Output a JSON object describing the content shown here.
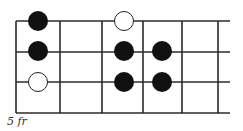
{
  "diagram": {
    "type": "fretboard-scale-pattern",
    "fret_label": "5 fr",
    "colors": {
      "line": "#2b2b2b",
      "filled_dot": "#111111",
      "open_dot_fill": "#ffffff",
      "open_dot_stroke": "#222222"
    },
    "strings_y": [
      21,
      52,
      82,
      113
    ],
    "frets_x": [
      16,
      60,
      102,
      143,
      182,
      218
    ],
    "string_end_x": 230,
    "dot_radius": 10,
    "dots": [
      {
        "string": 1,
        "x": 38,
        "y": 21,
        "kind": "filled"
      },
      {
        "string": 1,
        "x": 124,
        "y": 21,
        "kind": "open"
      },
      {
        "string": 2,
        "x": 38,
        "y": 51,
        "kind": "filled"
      },
      {
        "string": 2,
        "x": 124,
        "y": 51,
        "kind": "filled"
      },
      {
        "string": 2,
        "x": 162,
        "y": 51,
        "kind": "filled"
      },
      {
        "string": 3,
        "x": 38,
        "y": 82,
        "kind": "open"
      },
      {
        "string": 3,
        "x": 124,
        "y": 82,
        "kind": "filled"
      },
      {
        "string": 3,
        "x": 162,
        "y": 82,
        "kind": "filled"
      }
    ]
  }
}
